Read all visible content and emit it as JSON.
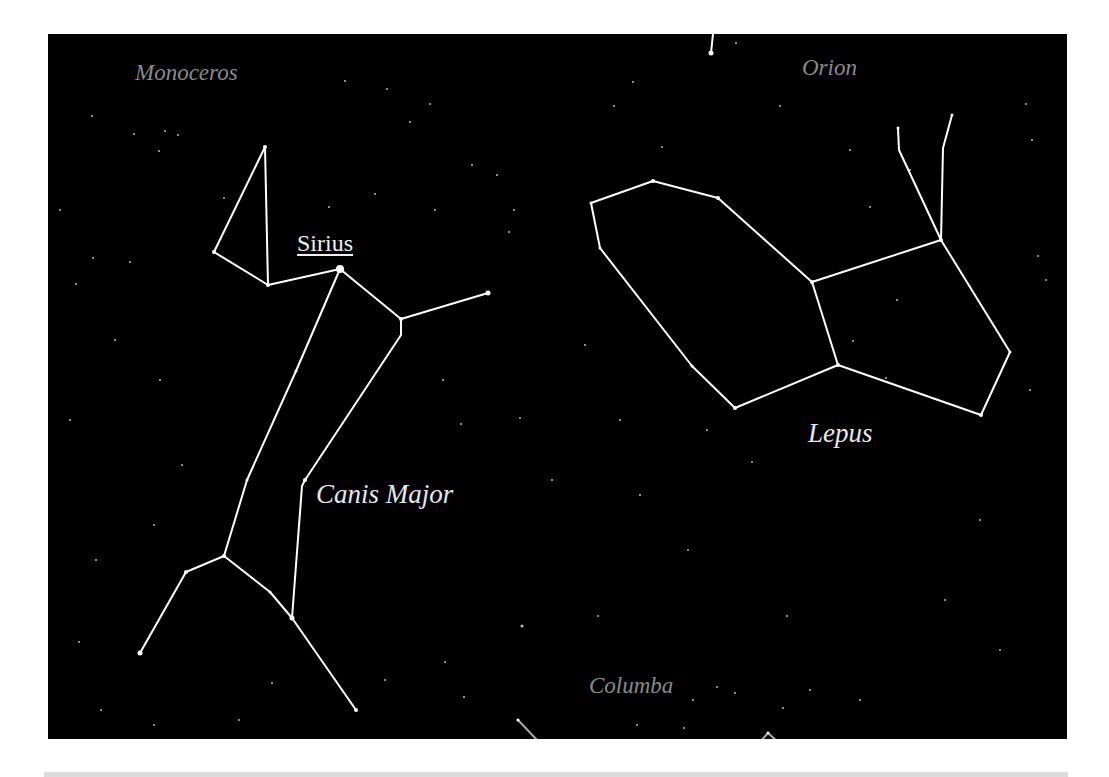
{
  "figure": {
    "background_color": "#000000",
    "line_color": "#ffffff",
    "labels": {
      "monoceros": "Monoceros",
      "orion": "Orion",
      "sirius": "Sirius",
      "lepus": "Lepus",
      "canis_major": "Canis Major",
      "columba": "Columba"
    },
    "constellations": [
      {
        "name": "Canis Major",
        "highlight_star": "Sirius"
      },
      {
        "name": "Lepus"
      },
      {
        "name": "Orion"
      },
      {
        "name": "Monoceros"
      },
      {
        "name": "Columba"
      }
    ]
  }
}
